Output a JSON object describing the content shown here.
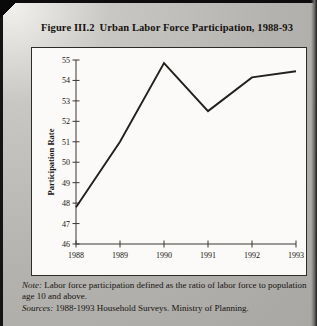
{
  "figure": {
    "number": "Figure III.2",
    "title": "Urban Labor Force Participation, 1988-93"
  },
  "notes": {
    "note_label": "Note:",
    "note_text": "Labor force participation defined as the ratio of labor force to population age 10 and above.",
    "sources_label": "Sources:",
    "sources_text": "1988-1993 Household Surveys. Ministry of Planning."
  },
  "chart_data": {
    "type": "line",
    "xlabel": "",
    "ylabel": "Participation Rate",
    "x": [
      1988,
      1989,
      1990,
      1991,
      1992,
      1993
    ],
    "xtick_labels": [
      "1988",
      "1989",
      "1990",
      "1991",
      "1992",
      "1993"
    ],
    "values": [
      47.8,
      51.0,
      54.85,
      52.5,
      54.15,
      54.45
    ],
    "ytick_labels": [
      "46",
      "47",
      "48",
      "49",
      "50",
      "51",
      "52",
      "53",
      "54",
      "55"
    ],
    "yticks": [
      46,
      47,
      48,
      49,
      50,
      51,
      52,
      53,
      54,
      55
    ],
    "ylim": [
      46,
      55
    ],
    "xlim": [
      1988,
      1993
    ],
    "grid": false,
    "legend": "none",
    "series_color": "#231f1c",
    "vertices": [
      1988,
      1990,
      1991,
      1992,
      1993
    ]
  }
}
